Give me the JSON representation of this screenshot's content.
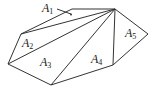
{
  "diagram": {
    "type": "polygon-triangulation",
    "vertices": [
      {
        "id": "apex",
        "x": 115,
        "y": 9
      },
      {
        "id": "top-left",
        "x": 72,
        "y": 9
      },
      {
        "id": "left-upper",
        "x": 21,
        "y": 34
      },
      {
        "id": "left-lower",
        "x": 8,
        "y": 64
      },
      {
        "id": "bottom",
        "x": 51,
        "y": 85
      },
      {
        "id": "bottom-right",
        "x": 113,
        "y": 65
      },
      {
        "id": "right",
        "x": 148,
        "y": 34
      }
    ],
    "regions": [
      {
        "name": "A",
        "sub": "1",
        "x": 39,
        "y": 12
      },
      {
        "name": "A",
        "sub": "2",
        "x": 22,
        "y": 47
      },
      {
        "name": "A",
        "sub": "3",
        "x": 40,
        "y": 66
      },
      {
        "name": "A",
        "sub": "4",
        "x": 91,
        "y": 63
      },
      {
        "name": "A",
        "sub": "5",
        "x": 125,
        "y": 37
      }
    ],
    "colors": {
      "stroke": "#333333",
      "text": "#222222"
    }
  }
}
